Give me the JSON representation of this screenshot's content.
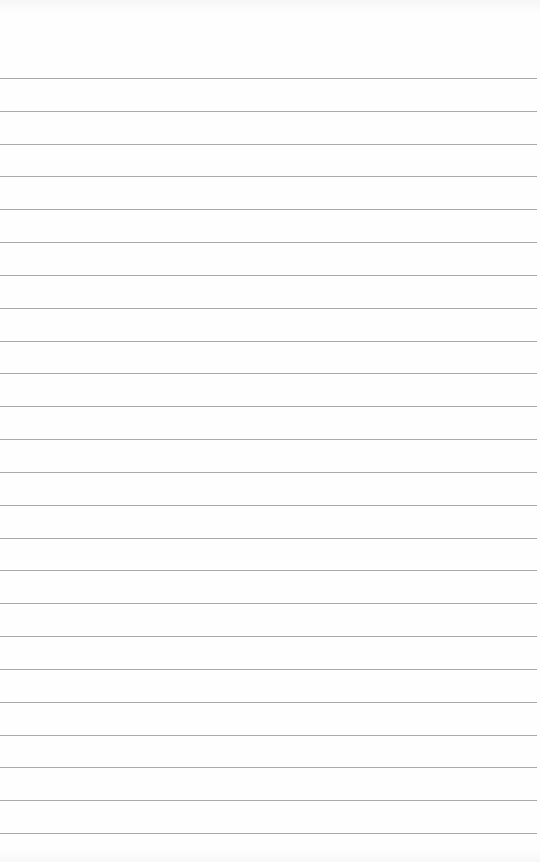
{
  "page": {
    "type": "ruled-notepad-sheet",
    "background_color": "#fefefe",
    "rule_color": "#a9a9a9",
    "rule_count": 24,
    "first_rule_y": 78,
    "rule_spacing": 32.83,
    "rule_width": 537,
    "text_content": ""
  }
}
